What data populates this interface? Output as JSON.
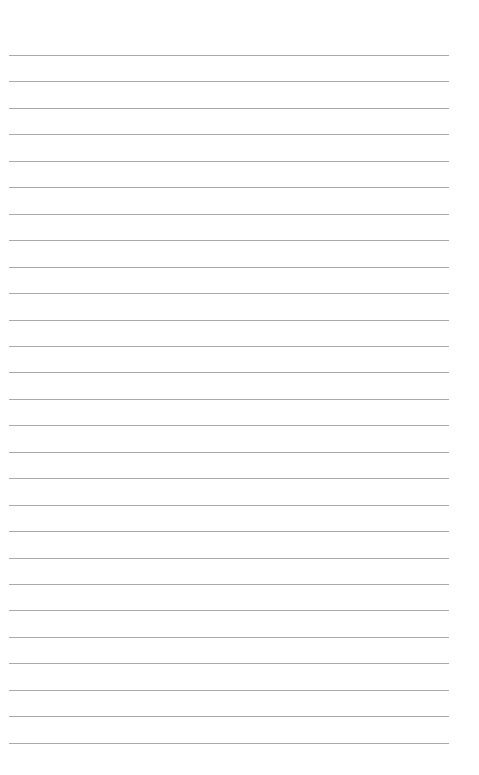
{
  "page": {
    "type": "blank ruled sheet",
    "background_color": "#ffffff",
    "line_color": "#a9a9a9",
    "line_count": 27,
    "first_line_y": 55,
    "line_spacing": 26.45,
    "line_left": 9,
    "line_width": 440
  }
}
